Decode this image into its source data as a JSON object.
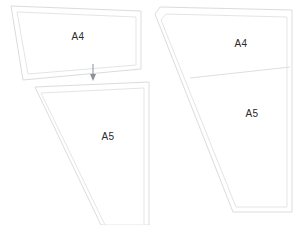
{
  "diagram": {
    "background_color": "#ffffff",
    "outline_color": "#d9dcdf",
    "inner_outline_color": "#e2e5e8",
    "divider_color": "#dcdfe2",
    "label_color": "#2b2b2b",
    "arrow_color": "#8d9196",
    "left_group": {
      "top_shape": {
        "label": "A4",
        "label_x": 78,
        "label_y": 37,
        "outer_points": "11,6 141,11 141,69 23,80",
        "inner_points": "17,12 136,17 136,65 28,74"
      },
      "bottom_shape": {
        "label": "A5",
        "label_x": 108,
        "label_y": 137,
        "outer_points": "35,87 149,82 149,225 101,225",
        "inner_points": "41,93 144,88 144,225 105,225"
      },
      "arrow": {
        "name": "down-arrow",
        "x": 93,
        "y_start": 64,
        "y_end": 80
      }
    },
    "right_group": {
      "combined_shape": {
        "outer_points": "160,7 292,10 292,212 233,212 155,14",
        "inner_points": "166,14 287,17 287,207 236,207 161,20"
      },
      "divider": {
        "name": "a4-a5-divider",
        "points": "190,78 290,67"
      },
      "top_label": {
        "label": "A4",
        "label_x": 241,
        "label_y": 44
      },
      "bottom_label": {
        "label": "A5",
        "label_x": 252,
        "label_y": 114
      }
    }
  }
}
